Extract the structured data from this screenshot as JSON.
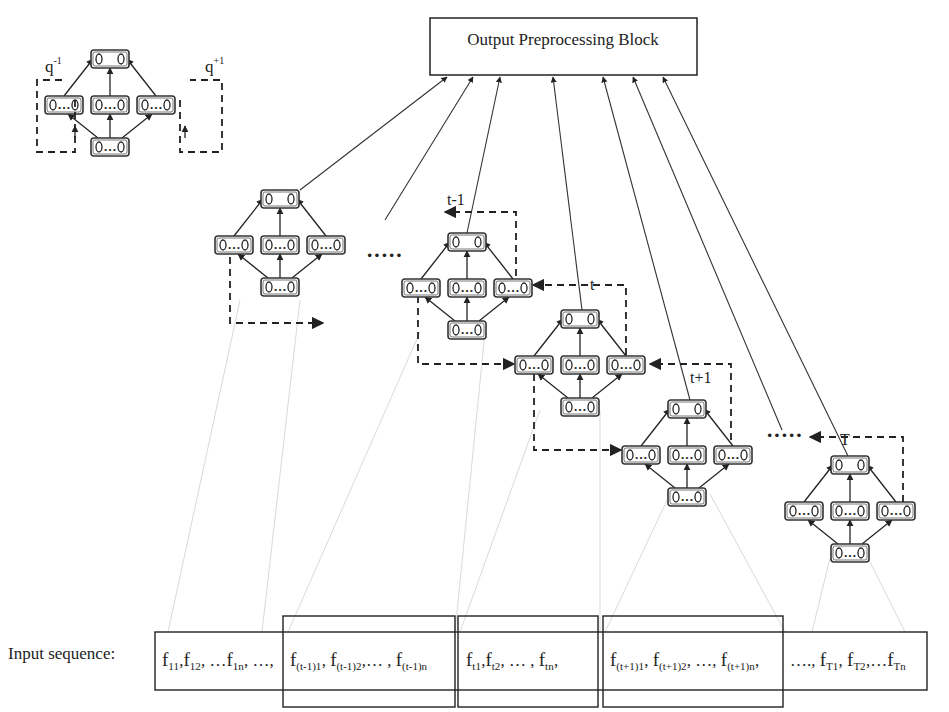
{
  "output_block": {
    "label": "Output Preprocessing Block"
  },
  "inset": {
    "left_label_base": "q",
    "left_label_sup": "-1",
    "right_label_base": "q",
    "right_label_sup": "+1"
  },
  "node_glyphs": {
    "top": "o   o",
    "hidden": "o …o",
    "input": "o …o"
  },
  "networks": [
    {
      "id": "net-1",
      "label": "",
      "x": 215,
      "y": 190
    },
    {
      "id": "net-t-1",
      "label": "t-1",
      "x": 402,
      "y": 233
    },
    {
      "id": "net-t",
      "label": "t",
      "x": 515,
      "y": 310
    },
    {
      "id": "net-t+1",
      "label": "t+1",
      "x": 622,
      "y": 400
    },
    {
      "id": "net-T",
      "label": "T",
      "x": 785,
      "y": 456
    }
  ],
  "ellipsis": [
    "·····",
    "·····"
  ],
  "input_sequence": {
    "label": "Input sequence:",
    "segments": [
      {
        "id": "seg-1",
        "text": "f11,f12, …f1n, …,"
      },
      {
        "id": "seg-t-1",
        "text": "f(t-1)1 , f(t-1)2 ,… , f(t-1)n"
      },
      {
        "id": "seg-t",
        "text": "ft1 ,ft2, … , ftn ,"
      },
      {
        "id": "seg-t+1",
        "text": "f(t+1)1, f(t+1)2 , …, f(t+1)n,"
      },
      {
        "id": "seg-T",
        "text": "…., fT1, fT2,…fTn"
      }
    ]
  },
  "colors": {
    "stroke": "#222222",
    "background": "#ffffff",
    "guide_lines": "#cfcfcf"
  }
}
